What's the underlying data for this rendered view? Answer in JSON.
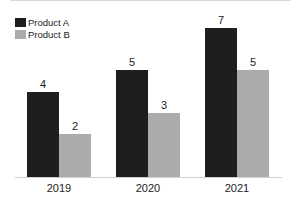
{
  "colors": {
    "Product A": "#1e1e1e",
    "Product B": "#ababab"
  },
  "legend": [
    {
      "label": "Product A",
      "color": "#1e1e1e"
    },
    {
      "label": "Product B",
      "color": "#ababab"
    }
  ],
  "chart_data": {
    "type": "bar",
    "title": "",
    "xlabel": "",
    "ylabel": "",
    "categories": [
      "2019",
      "2020",
      "2021"
    ],
    "series": [
      {
        "name": "Product A",
        "values": [
          4,
          5,
          7
        ]
      },
      {
        "name": "Product B",
        "values": [
          2,
          3,
          5
        ]
      }
    ],
    "ylim": [
      0,
      7
    ],
    "grid": false,
    "legend_position": "top-left",
    "data_labels": true
  }
}
